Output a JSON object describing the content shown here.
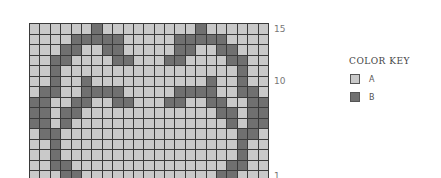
{
  "chart": {
    "columns": 23,
    "rows": 15,
    "row_labels": [
      {
        "text": "15",
        "row": 0
      },
      {
        "text": "10",
        "row": 5
      },
      {
        "text": "1",
        "row": 14
      }
    ],
    "colors": {
      "A": "#c9c9c9",
      "B": "#707070",
      "grid": "#3a3a3a"
    },
    "dark_cells_by_row": [
      [
        7,
        17
      ],
      [
        5,
        6,
        7,
        8,
        9,
        15,
        16,
        17,
        18,
        19
      ],
      [
        4,
        5,
        8,
        9,
        15,
        16,
        19,
        20
      ],
      [
        3,
        4,
        9,
        10,
        14,
        15,
        20,
        21
      ],
      [
        3,
        21
      ],
      [
        3,
        6,
        18,
        21
      ],
      [
        2,
        3,
        6,
        7,
        8,
        9,
        15,
        16,
        17,
        18,
        21,
        22
      ],
      [
        1,
        2,
        5,
        6,
        9,
        10,
        14,
        15,
        18,
        19,
        22,
        23
      ],
      [
        1,
        2,
        4,
        5,
        19,
        20,
        22,
        23
      ],
      [
        1,
        2,
        4,
        20,
        22,
        23
      ],
      [
        2,
        3,
        21,
        22
      ],
      [
        3,
        21
      ],
      [
        3,
        21
      ],
      [
        3,
        4,
        20,
        21
      ],
      [
        4,
        5,
        19,
        20
      ]
    ]
  },
  "color_key": {
    "title": "COLOR KEY",
    "items": [
      {
        "label": "A",
        "color": "#c9c9c9"
      },
      {
        "label": "B",
        "color": "#707070"
      }
    ]
  }
}
